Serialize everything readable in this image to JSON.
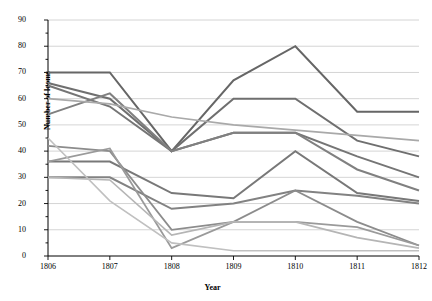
{
  "chart_data": {
    "type": "line",
    "title": "",
    "xlabel": "Year",
    "ylabel": "Number of looms",
    "x": [
      1806,
      1807,
      1808,
      1809,
      1810,
      1811,
      1812
    ],
    "xticklabels": [
      "1806",
      "1807",
      "1808",
      "1809",
      "1810",
      "1811",
      "1812"
    ],
    "yticklabels": [
      "0",
      "10",
      "20",
      "30",
      "40",
      "50",
      "60",
      "70",
      "80",
      "90"
    ],
    "yticks": [
      0,
      10,
      20,
      30,
      40,
      50,
      60,
      70,
      80,
      90
    ],
    "ylim": [
      0,
      90
    ],
    "grid": true,
    "legend": "none",
    "series": [
      {
        "name": "series-1",
        "color": "#666666",
        "width": 2.0,
        "values": [
          70,
          70,
          40,
          67,
          80,
          55,
          55
        ]
      },
      {
        "name": "series-2",
        "color": "#6f6f6f",
        "width": 2.0,
        "values": [
          66,
          60,
          40,
          60,
          60,
          44,
          38
        ]
      },
      {
        "name": "series-3",
        "color": "#757575",
        "width": 2.0,
        "values": [
          65,
          57,
          40,
          47,
          47,
          38,
          30
        ]
      },
      {
        "name": "series-4",
        "color": "#808080",
        "width": 2.0,
        "values": [
          54,
          62,
          40,
          47,
          47,
          33,
          25
        ]
      },
      {
        "name": "series-5",
        "color": "#a9a9a9",
        "width": 1.6,
        "values": [
          60,
          58,
          53,
          50,
          48,
          46,
          44
        ]
      },
      {
        "name": "series-6",
        "color": "#787878",
        "width": 2.0,
        "values": [
          36,
          36,
          24,
          22,
          40,
          24,
          21
        ]
      },
      {
        "name": "series-7",
        "color": "#828282",
        "width": 2.0,
        "values": [
          30,
          30,
          18,
          20,
          25,
          23,
          20
        ]
      },
      {
        "name": "series-8",
        "color": "#8c8c8c",
        "width": 1.8,
        "values": [
          42,
          40,
          10,
          13,
          25,
          13,
          4
        ]
      },
      {
        "name": "series-9",
        "color": "#9a9a9a",
        "width": 1.8,
        "values": [
          36,
          41,
          3,
          13,
          13,
          11,
          4
        ]
      },
      {
        "name": "series-10",
        "color": "#b5b5b5",
        "width": 1.6,
        "values": [
          30,
          29,
          8,
          13,
          13,
          7,
          3
        ]
      },
      {
        "name": "series-11",
        "color": "#c0c0c0",
        "width": 1.6,
        "values": [
          45,
          21,
          5,
          2,
          2,
          2,
          2
        ]
      }
    ]
  },
  "axes": {
    "y_title": "Number of looms",
    "x_title": "Year"
  }
}
